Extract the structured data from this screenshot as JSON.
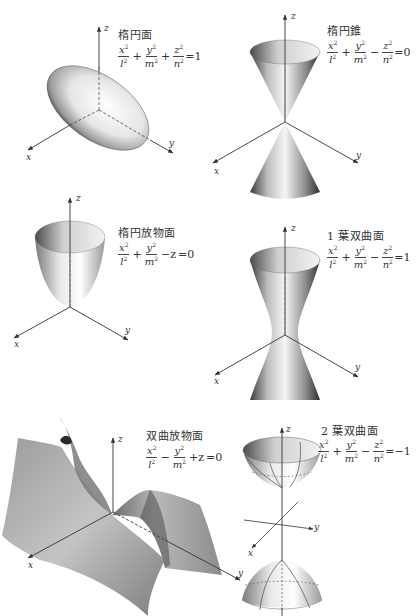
{
  "figures": [
    {
      "id": "ellipsoid",
      "title": "楕円面",
      "formula": {
        "terms": [
          {
            "sign": "",
            "num": "x",
            "den": "l"
          },
          {
            "sign": "+",
            "num": "y",
            "den": "m"
          },
          {
            "sign": "+",
            "num": "z",
            "den": "n"
          }
        ],
        "rhs": "=1"
      },
      "axes": {
        "x": "x",
        "y": "y",
        "z": "z"
      }
    },
    {
      "id": "elliptic-cone",
      "title": "楕円錐",
      "formula": {
        "terms": [
          {
            "sign": "",
            "num": "x",
            "den": "l"
          },
          {
            "sign": "+",
            "num": "y",
            "den": "m"
          },
          {
            "sign": "−",
            "num": "z",
            "den": "n"
          }
        ],
        "rhs": "=0"
      },
      "axes": {
        "x": "x",
        "y": "y",
        "z": "z"
      }
    },
    {
      "id": "elliptic-paraboloid",
      "title": "楕円放物面",
      "formula": {
        "terms": [
          {
            "sign": "",
            "num": "x",
            "den": "l"
          },
          {
            "sign": "+",
            "num": "y",
            "den": "m"
          }
        ],
        "tail": "−z",
        "rhs": "=0"
      },
      "axes": {
        "x": "x",
        "y": "y",
        "z": "z"
      }
    },
    {
      "id": "hyperboloid-one-sheet",
      "title": "1 葉双曲面",
      "formula": {
        "terms": [
          {
            "sign": "",
            "num": "x",
            "den": "l"
          },
          {
            "sign": "+",
            "num": "y",
            "den": "m"
          },
          {
            "sign": "−",
            "num": "z",
            "den": "n"
          }
        ],
        "rhs": "=1"
      },
      "axes": {
        "x": "x",
        "y": "y",
        "z": "z"
      }
    },
    {
      "id": "hyperbolic-paraboloid",
      "title": "双曲放物面",
      "formula": {
        "terms": [
          {
            "sign": "",
            "num": "x",
            "den": "l"
          },
          {
            "sign": "−",
            "num": "y",
            "den": "m"
          }
        ],
        "tail": "+z",
        "rhs": "=0"
      },
      "axes": {
        "x": "x",
        "y": "y",
        "z": "z"
      }
    },
    {
      "id": "hyperboloid-two-sheets",
      "title": "2 葉双曲面",
      "formula": {
        "terms": [
          {
            "sign": "",
            "num": "x",
            "den": "l"
          },
          {
            "sign": "+",
            "num": "y",
            "den": "m"
          },
          {
            "sign": "−",
            "num": "z",
            "den": "n"
          }
        ],
        "rhs": "=−1"
      },
      "axes": {
        "x": "x",
        "y": "y",
        "z": "z"
      }
    }
  ],
  "colors": {
    "axis": "#333333",
    "surface_light": "#f4f4f4",
    "surface_mid": "#bdbdbd",
    "surface_dark": "#555555"
  }
}
